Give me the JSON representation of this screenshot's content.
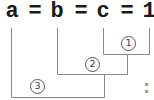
{
  "diagram": {
    "tokens": [
      "a",
      "=",
      "b",
      "=",
      "c",
      "=",
      "1"
    ],
    "steps": [
      {
        "label": "1",
        "joins": [
          "c",
          "1"
        ]
      },
      {
        "label": "2",
        "joins": [
          "b",
          "step 1"
        ]
      },
      {
        "label": "3",
        "joins": [
          "a",
          "step 2"
        ]
      }
    ],
    "colors": {
      "text": "#1a1a1a",
      "line": "#888888",
      "circle": "#555555"
    }
  }
}
